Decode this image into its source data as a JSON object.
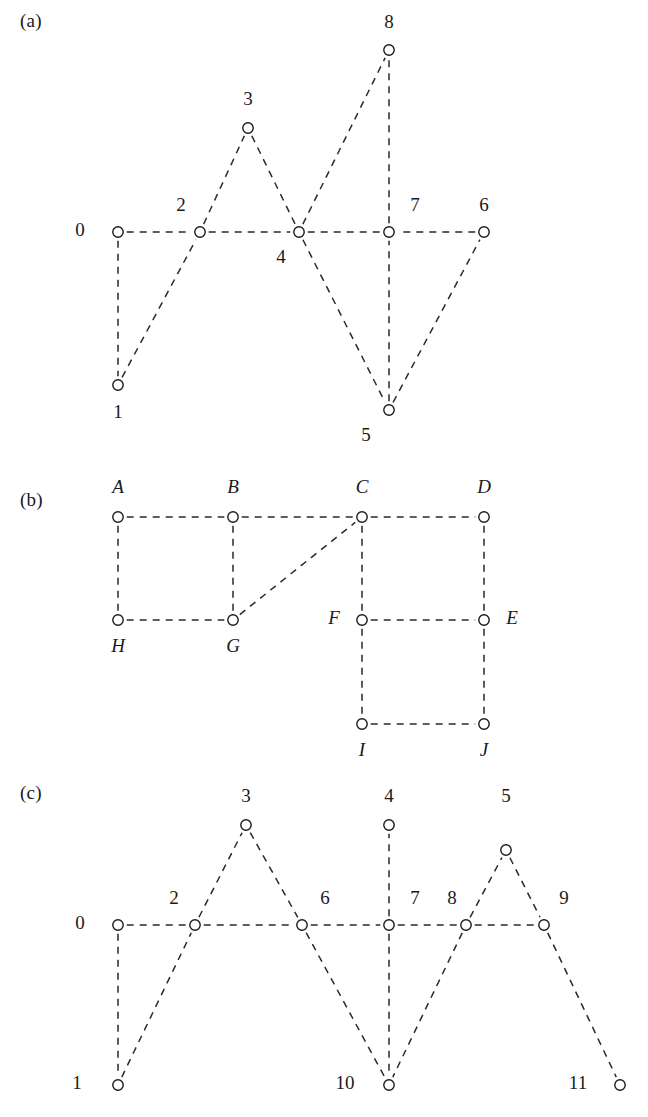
{
  "figure": {
    "type": "graph-diagram-figure",
    "background": "#ffffff",
    "ink_color": "#1a1a1a",
    "panel_count": 3
  },
  "panels": [
    {
      "id": "a",
      "tag": "(a)",
      "node_style": "numeric",
      "nodes": [
        {
          "id": "0",
          "label": "0",
          "x": 118,
          "y": 232,
          "label_x": 80,
          "label_y": 232,
          "label_italic": false
        },
        {
          "id": "1",
          "label": "1",
          "x": 118,
          "y": 385,
          "label_x": 118,
          "label_y": 414,
          "label_italic": false
        },
        {
          "id": "2",
          "label": "2",
          "x": 200,
          "y": 232,
          "label_x": 181,
          "label_y": 207,
          "label_italic": false
        },
        {
          "id": "3",
          "label": "3",
          "x": 248,
          "y": 128,
          "label_x": 248,
          "label_y": 101,
          "label_italic": false
        },
        {
          "id": "4",
          "label": "4",
          "x": 299,
          "y": 232,
          "label_x": 281,
          "label_y": 259,
          "label_italic": false
        },
        {
          "id": "5",
          "label": "5",
          "x": 389,
          "y": 410,
          "label_x": 366,
          "label_y": 437,
          "label_italic": false
        },
        {
          "id": "6",
          "label": "6",
          "x": 484,
          "y": 232,
          "label_x": 484,
          "label_y": 207,
          "label_italic": false
        },
        {
          "id": "7",
          "label": "7",
          "x": 389,
          "y": 232,
          "label_x": 415,
          "label_y": 207,
          "label_italic": false
        },
        {
          "id": "8",
          "label": "8",
          "x": 389,
          "y": 50,
          "label_x": 389,
          "label_y": 24,
          "label_italic": false
        }
      ],
      "edges": [
        [
          "0",
          "1"
        ],
        [
          "0",
          "2"
        ],
        [
          "1",
          "2"
        ],
        [
          "2",
          "3"
        ],
        [
          "2",
          "4"
        ],
        [
          "3",
          "4"
        ],
        [
          "4",
          "5"
        ],
        [
          "4",
          "7"
        ],
        [
          "4",
          "8"
        ],
        [
          "5",
          "6"
        ],
        [
          "5",
          "7"
        ],
        [
          "6",
          "7"
        ],
        [
          "7",
          "8"
        ]
      ]
    },
    {
      "id": "b",
      "tag": "(b)",
      "node_style": "alpha",
      "nodes": [
        {
          "id": "A",
          "label": "A",
          "x": 118,
          "y": 517,
          "label_x": 118,
          "label_y": 489,
          "label_italic": true
        },
        {
          "id": "B",
          "label": "B",
          "x": 233,
          "y": 517,
          "label_x": 233,
          "label_y": 489,
          "label_italic": true
        },
        {
          "id": "C",
          "label": "C",
          "x": 362,
          "y": 517,
          "label_x": 362,
          "label_y": 489,
          "label_italic": true
        },
        {
          "id": "D",
          "label": "D",
          "x": 484,
          "y": 517,
          "label_x": 484,
          "label_y": 489,
          "label_italic": true
        },
        {
          "id": "H",
          "label": "H",
          "x": 118,
          "y": 620,
          "label_x": 118,
          "label_y": 648,
          "label_italic": true
        },
        {
          "id": "G",
          "label": "G",
          "x": 233,
          "y": 620,
          "label_x": 233,
          "label_y": 648,
          "label_italic": true
        },
        {
          "id": "F",
          "label": "F",
          "x": 362,
          "y": 620,
          "label_x": 334,
          "label_y": 620,
          "label_italic": true
        },
        {
          "id": "E",
          "label": "E",
          "x": 484,
          "y": 620,
          "label_x": 512,
          "label_y": 620,
          "label_italic": true
        },
        {
          "id": "I",
          "label": "I",
          "x": 362,
          "y": 724,
          "label_x": 362,
          "label_y": 752,
          "label_italic": true
        },
        {
          "id": "J",
          "label": "J",
          "x": 484,
          "y": 724,
          "label_x": 484,
          "label_y": 752,
          "label_italic": true
        }
      ],
      "edges": [
        [
          "A",
          "B"
        ],
        [
          "B",
          "C"
        ],
        [
          "C",
          "D"
        ],
        [
          "A",
          "H"
        ],
        [
          "B",
          "G"
        ],
        [
          "C",
          "F"
        ],
        [
          "D",
          "E"
        ],
        [
          "H",
          "G"
        ],
        [
          "G",
          "C"
        ],
        [
          "F",
          "E"
        ],
        [
          "F",
          "I"
        ],
        [
          "E",
          "J"
        ],
        [
          "I",
          "J"
        ]
      ]
    },
    {
      "id": "c",
      "tag": "(c)",
      "node_style": "numeric",
      "nodes": [
        {
          "id": "0",
          "label": "0",
          "x": 118,
          "y": 925,
          "label_x": 80,
          "label_y": 925,
          "label_italic": false
        },
        {
          "id": "1",
          "label": "1",
          "x": 118,
          "y": 1085,
          "label_x": 77,
          "label_y": 1085,
          "label_italic": false
        },
        {
          "id": "2",
          "label": "2",
          "x": 195,
          "y": 925,
          "label_x": 174,
          "label_y": 900,
          "label_italic": false
        },
        {
          "id": "3",
          "label": "3",
          "x": 246,
          "y": 825,
          "label_x": 246,
          "label_y": 798,
          "label_italic": false
        },
        {
          "id": "4",
          "label": "4",
          "x": 389,
          "y": 825,
          "label_x": 389,
          "label_y": 798,
          "label_italic": false
        },
        {
          "id": "5",
          "label": "5",
          "x": 506,
          "y": 850,
          "label_x": 506,
          "label_y": 798,
          "label_italic": false
        },
        {
          "id": "6",
          "label": "6",
          "x": 302,
          "y": 925,
          "label_x": 325,
          "label_y": 900,
          "label_italic": false
        },
        {
          "id": "7",
          "label": "7",
          "x": 389,
          "y": 925,
          "label_x": 415,
          "label_y": 900,
          "label_italic": false
        },
        {
          "id": "8",
          "label": "8",
          "x": 466,
          "y": 925,
          "label_x": 452,
          "label_y": 900,
          "label_italic": false
        },
        {
          "id": "9",
          "label": "9",
          "x": 544,
          "y": 925,
          "label_x": 564,
          "label_y": 900,
          "label_italic": false
        },
        {
          "id": "10",
          "label": "10",
          "x": 389,
          "y": 1085,
          "label_x": 345,
          "label_y": 1085,
          "label_italic": false
        },
        {
          "id": "11",
          "label": "11",
          "x": 620,
          "y": 1085,
          "label_x": 578,
          "label_y": 1085,
          "label_italic": false
        }
      ],
      "edges": [
        [
          "0",
          "1"
        ],
        [
          "0",
          "2"
        ],
        [
          "1",
          "2"
        ],
        [
          "2",
          "3"
        ],
        [
          "2",
          "6"
        ],
        [
          "3",
          "6"
        ],
        [
          "6",
          "7"
        ],
        [
          "6",
          "10"
        ],
        [
          "7",
          "4"
        ],
        [
          "7",
          "8"
        ],
        [
          "7",
          "10"
        ],
        [
          "8",
          "10"
        ],
        [
          "8",
          "5"
        ],
        [
          "8",
          "9"
        ],
        [
          "5",
          "9"
        ],
        [
          "9",
          "11"
        ]
      ]
    }
  ],
  "style": {
    "edge_dash": "7 6",
    "node_radius": 5.2,
    "edge_color": "#2a2a2a",
    "node_fill": "#ffffff",
    "node_stroke": "#1a1a1a"
  }
}
